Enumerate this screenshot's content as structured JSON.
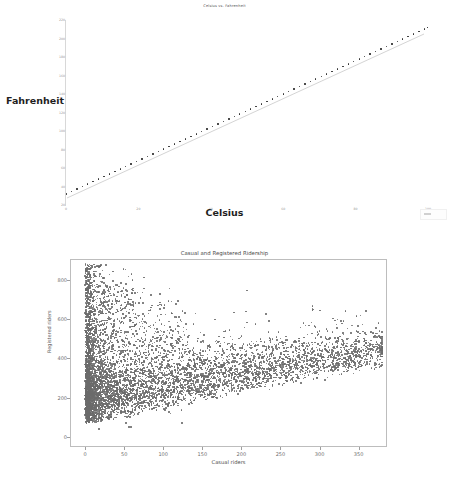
{
  "page": {
    "background_color": "#ffffff"
  },
  "figures": [
    {
      "id": "celsius-fahrenheit",
      "title": "Celsius vs. Fahrenheit",
      "xlabel": "Celsius",
      "ylabel": "Fahrenheit",
      "legend_label": "data"
    },
    {
      "id": "ridership",
      "title": "Casual and Registered Ridership",
      "xlabel": "Casual riders",
      "ylabel": "Registered riders"
    }
  ],
  "chart_data": [
    {
      "type": "scatter",
      "title": "Celsius vs. Fahrenheit",
      "xlabel": "Celsius",
      "ylabel": "Fahrenheit",
      "xlim": [
        0,
        100
      ],
      "ylim": [
        20,
        220
      ],
      "grid": false,
      "legend_position": "lower right",
      "xticks": [
        0,
        20,
        40,
        60,
        80,
        100
      ],
      "yticks": [
        20,
        40,
        60,
        80,
        100,
        120,
        140,
        160,
        180,
        200,
        220
      ],
      "marker_color": "#2b2b2b",
      "line_color": "#b9b9b9",
      "relation": "F = C * 9/5 + 32",
      "x": [
        0,
        1.5,
        3,
        4.5,
        6,
        7.5,
        9,
        10.5,
        12,
        13.5,
        15,
        16.5,
        18,
        19.5,
        21,
        22.5,
        24,
        25.5,
        27,
        28.5,
        30,
        31.5,
        33,
        34.5,
        36,
        37.5,
        39,
        40.5,
        42,
        43.5,
        45,
        46.5,
        48,
        49.5,
        51,
        52.5,
        54,
        55.5,
        57,
        58.5,
        60,
        61.5,
        63,
        64.5,
        66,
        67.5,
        69,
        70.5,
        72,
        73.5,
        75,
        76.5,
        78,
        79.5,
        81,
        82.5,
        84,
        85.5,
        87,
        88.5,
        90,
        91.5,
        93,
        94.5,
        96,
        97.5,
        99,
        100
      ],
      "y": [
        32,
        34.7,
        37.4,
        40.1,
        42.8,
        45.5,
        48.2,
        50.9,
        53.6,
        56.3,
        59,
        61.7,
        64.4,
        67.1,
        69.8,
        72.5,
        75.2,
        77.9,
        80.6,
        83.3,
        86,
        88.7,
        91.4,
        94.1,
        96.8,
        99.5,
        102.2,
        104.9,
        107.6,
        110.3,
        113,
        115.7,
        118.4,
        121.1,
        123.8,
        126.5,
        129.2,
        131.9,
        134.6,
        137.3,
        140,
        142.7,
        145.4,
        148.1,
        150.8,
        153.5,
        156.2,
        158.9,
        161.6,
        164.3,
        167,
        169.7,
        172.4,
        175.1,
        177.8,
        180.5,
        183.2,
        185.9,
        188.6,
        191.3,
        194,
        196.7,
        199.4,
        202.1,
        204.8,
        207.5,
        210.2,
        212
      ]
    },
    {
      "type": "scatter",
      "title": "Casual and Registered Ridership",
      "xlabel": "Casual riders",
      "ylabel": "Registered riders",
      "xlim": [
        -18,
        385
      ],
      "ylim": [
        -45,
        900
      ],
      "grid": false,
      "xticks": [
        0,
        50,
        100,
        150,
        200,
        250,
        300,
        350
      ],
      "yticks": [
        0,
        200,
        400,
        600,
        800
      ],
      "marker_color": "#6b6b6b",
      "n_points": 17379,
      "description": "Dense cloud concentrated near low casual-rider counts with a long right tail; registered riders span 0-880 with greatest density below 300."
    }
  ]
}
